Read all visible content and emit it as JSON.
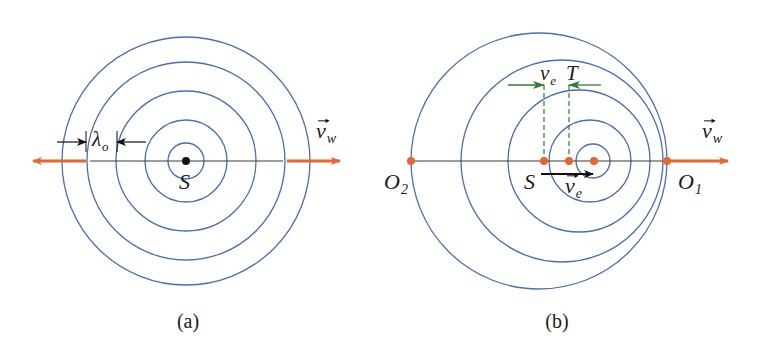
{
  "colors": {
    "wave": "#4a6db5",
    "orange": "#e8652e",
    "axis": "#3a3a3a",
    "green": "#2e7d32",
    "black": "#111111"
  },
  "panels": [
    {
      "id": "a",
      "caption": "(a)",
      "caption_pos": [
        188,
        328
      ],
      "wavefronts": [
        {
          "cx": 186,
          "cy": 161,
          "r": 18
        },
        {
          "cx": 186,
          "cy": 161,
          "r": 41
        },
        {
          "cx": 186,
          "cy": 161,
          "r": 70
        },
        {
          "cx": 186,
          "cy": 161,
          "r": 99
        },
        {
          "cx": 186,
          "cy": 161,
          "r": 124
        }
      ],
      "axis_line": {
        "x1": 90,
        "x2": 283,
        "y": 161
      },
      "orange_arrows": [
        {
          "x1": 86,
          "x2": 33,
          "y": 161
        },
        {
          "x1": 287,
          "x2": 340,
          "y": 161
        }
      ],
      "source": {
        "x": 186,
        "y": 161,
        "r": 4,
        "label": "S",
        "label_pos": [
          179,
          189
        ]
      },
      "velocity_label": {
        "text": "v",
        "sub": "w",
        "pos": [
          316,
          138
        ],
        "vector": true
      },
      "wavelength": {
        "label": "λ",
        "sub": "o",
        "label_pos": [
          92,
          146
        ],
        "left_tick_x": 86,
        "right_tick_x": 117,
        "tick_y1": 131,
        "tick_y2": 152,
        "arrow_y": 142,
        "left_arrow_from": 57,
        "right_arrow_from": 146
      }
    },
    {
      "id": "b",
      "caption": "(b)",
      "caption_pos": [
        557,
        328
      ],
      "wavefronts": [
        {
          "cx": 593,
          "cy": 161,
          "r": 17
        },
        {
          "cx": 590,
          "cy": 161,
          "r": 41
        },
        {
          "cx": 579,
          "cy": 161,
          "r": 71
        },
        {
          "cx": 562,
          "cy": 161,
          "r": 101
        },
        {
          "cx": 539,
          "cy": 161,
          "r": 128
        }
      ],
      "axis_line": {
        "x1": 411,
        "x2": 667,
        "y": 161
      },
      "orange_arrows": [
        {
          "x1": 667,
          "x2": 728,
          "y": 161
        }
      ],
      "points": [
        {
          "name": "O2",
          "x": 411,
          "y": 161,
          "label": "O",
          "sub": "2",
          "label_pos": [
            384,
            189
          ]
        },
        {
          "name": "S",
          "x": 544,
          "y": 161,
          "label": "S",
          "sub": "",
          "label_pos": [
            524,
            189
          ]
        },
        {
          "name": "T-point",
          "x": 569,
          "y": 161,
          "label": "",
          "sub": "",
          "label_pos": [
            0,
            0
          ]
        },
        {
          "name": "source-now",
          "x": 594,
          "y": 161,
          "label": "",
          "sub": "",
          "label_pos": [
            0,
            0
          ]
        },
        {
          "name": "O1",
          "x": 667,
          "y": 161,
          "label": "O",
          "sub": "1",
          "label_pos": [
            678,
            189
          ]
        }
      ],
      "dot_radius": 4,
      "source_velocity": {
        "x1": 541,
        "x2": 593,
        "y": 174,
        "label": "v",
        "sub": "e",
        "label_pos": [
          565,
          193
        ],
        "vector": true
      },
      "velocity_label": {
        "text": "v",
        "sub": "w",
        "pos": [
          702,
          138
        ],
        "vector": true
      },
      "displacement": {
        "label_ve": {
          "text": "v",
          "sub": "e",
          "pos": [
            540,
            80
          ]
        },
        "label_T": {
          "text": "T",
          "pos": [
            566,
            80
          ]
        },
        "dash_left_x": 544,
        "dash_right_x": 569,
        "dash_y1": 85,
        "dash_y2": 161,
        "arrow_y": 85,
        "left_arrow_from": 508,
        "right_arrow_from": 601
      }
    }
  ]
}
